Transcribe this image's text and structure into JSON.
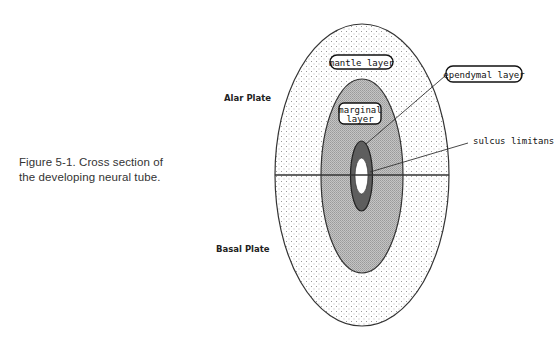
{
  "caption": {
    "line1": "Figure 5-1. Cross section of",
    "line2": "the developing neural tube."
  },
  "labels": {
    "alar_plate": "Alar Plate",
    "basal_plate": "Basal Plate",
    "mantle_layer": "mantle layer",
    "marginal_layer_line1": "marginal",
    "marginal_layer_line2": "layer",
    "ependymal_layer": "ependymal layer",
    "sulcus_limitans": "sulcus limitans"
  },
  "colors": {
    "outer_fill_dots": "#9a9a9a",
    "middle_fill": "#b4b4b4",
    "inner_fill": "#5e5e5e",
    "lumen_fill": "#ffffff",
    "outline": "#333333"
  }
}
